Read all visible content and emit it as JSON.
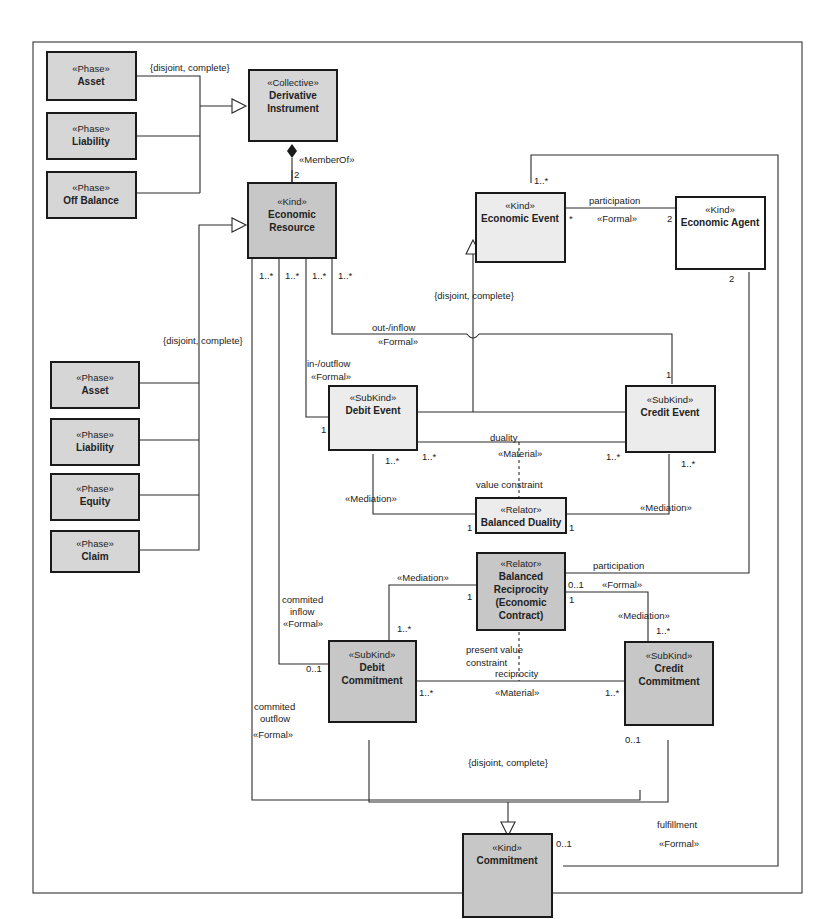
{
  "classes": {
    "asset_top": {
      "stereotype": "«Phase»",
      "name": "Asset"
    },
    "liability_top": {
      "stereotype": "«Phase»",
      "name": "Liability"
    },
    "off_balance": {
      "stereotype": "«Phase»",
      "name": "Off Balance"
    },
    "derivative_instrument": {
      "stereotype": "«Collective»",
      "name_line1": "Derivative",
      "name_line2": "Instrument"
    },
    "economic_resource": {
      "stereotype": "«Kind»",
      "name_line1": "Economic",
      "name_line2": "Resource"
    },
    "economic_event": {
      "stereotype": "«Kind»",
      "name": "Economic Event"
    },
    "economic_agent": {
      "stereotype": "«Kind»",
      "name": "Economic Agent"
    },
    "asset_bottom": {
      "stereotype": "«Phase»",
      "name": "Asset"
    },
    "liability_bottom": {
      "stereotype": "«Phase»",
      "name": "Liability"
    },
    "equity": {
      "stereotype": "«Phase»",
      "name": "Equity"
    },
    "claim": {
      "stereotype": "«Phase»",
      "name": "Claim"
    },
    "debit_event": {
      "stereotype": "«SubKind»",
      "name": "Debit Event"
    },
    "credit_event": {
      "stereotype": "«SubKind»",
      "name": "Credit Event"
    },
    "balanced_duality": {
      "stereotype": "«Relator»",
      "name": "Balanced Duality"
    },
    "balanced_reciprocity": {
      "stereotype": "«Relator»",
      "name_line1": "Balanced",
      "name_line2": "Reciprocity",
      "name_line3": "(Economic",
      "name_line4": "Contract)"
    },
    "debit_commitment": {
      "stereotype": "«SubKind»",
      "name_line1": "Debit",
      "name_line2": "Commitment"
    },
    "credit_commitment": {
      "stereotype": "«SubKind»",
      "name_line1": "Credit",
      "name_line2": "Commitment"
    },
    "commitment": {
      "stereotype": "«Kind»",
      "name": "Commitment"
    }
  },
  "labels": {
    "gs_top": "{disjoint, complete}",
    "gs_left": "{disjoint, complete}",
    "gs_event": "{disjoint, complete}",
    "gs_commitment": "{disjoint, complete}",
    "member_of": "«MemberOf»",
    "member_of_mult": "2",
    "res_mult_1": "1..*",
    "res_mult_2": "1..*",
    "res_mult_3": "1..*",
    "res_mult_4": "1..*",
    "participation_top": "participation",
    "participation_top_st": "«Formal»",
    "part_event_mult": "*",
    "part_agent_mult": "2",
    "event_top_mult": "1..*",
    "agent_bottom_mult": "2",
    "out_inflow": "out-/inflow",
    "out_inflow_st": "«Formal»",
    "in_outflow": "in-/outflow",
    "in_outflow_st": "«Formal»",
    "credit_top_mult": "1",
    "debit_left_mult": "1",
    "duality": "duality",
    "duality_st": "«Material»",
    "debit_dual_mult_a": "1..*",
    "debit_dual_mult_b": "1..*",
    "credit_dual_mult_a": "1..*",
    "credit_dual_mult_b": "1..*",
    "value_constraint": "value constraint",
    "mediation_left": "«Mediation»",
    "mediation_right": "«Mediation»",
    "bd_left_mult": "1",
    "bd_right_mult": "1",
    "participation_bottom": "participation",
    "participation_bottom_st": "«Formal»",
    "br_part_mult": "0..1",
    "br_med_right_mult": "1",
    "mediation_br_left": "«Mediation»",
    "br_med_left_mult": "1",
    "dc_med_mult": "1..*",
    "mediation_br_right": "«Mediation»",
    "cc_med_mult": "1..*",
    "commited_inflow_1": "commited",
    "commited_inflow_2": "inflow",
    "commited_inflow_st": "«Formal»",
    "dc_inflow_mult": "0..1",
    "present_value_1": "present value",
    "present_value_2": "constraint",
    "reciprocity": "reciprocity",
    "reciprocity_st": "«Material»",
    "dc_recip_mult": "1..*",
    "cc_recip_mult": "1..*",
    "commited_outflow_1": "commited",
    "commited_outflow_2": "outflow",
    "commited_outflow_st": "«Formal»",
    "cc_outflow_mult": "0..1",
    "fulfillment": "fulfillment",
    "fulfillment_st": "«Formal»",
    "commitment_mult": "0..1"
  }
}
